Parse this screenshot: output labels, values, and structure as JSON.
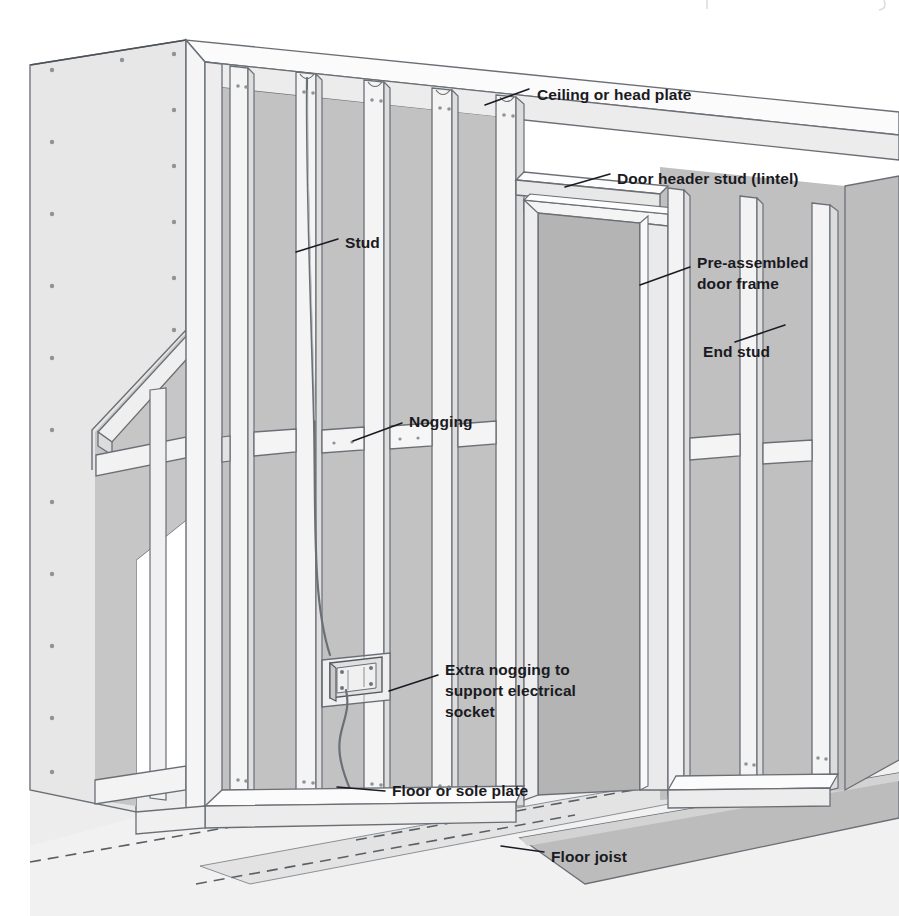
{
  "figure": {
    "type": "isometric-cutaway-diagram",
    "background_color": "#ffffff"
  },
  "palette": {
    "line": "#5a5f66",
    "line_dark": "#3d4248",
    "text": "#1a1a22",
    "board_face": "#e9e9e9",
    "board_face_light": "#efefef",
    "cavity": "#c3c3c3",
    "cavity_dark": "#b2b2b2",
    "door_opening": "#b4b4b4",
    "timber_face": "#f3f3f3",
    "timber_side": "#dcdcdc",
    "timber_top": "#fbfbfb",
    "floor": "#e4e4e4",
    "floor_dark": "#cfcfcf",
    "joist": "#bdbdbd"
  },
  "labels": [
    {
      "id": "ceiling-head-plate",
      "text": "Ceiling or head plate",
      "text_x": 537,
      "text_y": 94,
      "anchor": "start",
      "leader": "M 528 88 L 487 104"
    },
    {
      "id": "door-header-stud",
      "text": "Door header stud (lintel)",
      "text_x": 617,
      "text_y": 178,
      "anchor": "start",
      "leader": "M 609 173 L 566 186"
    },
    {
      "id": "stud",
      "text": "Stud",
      "text_x": 345,
      "text_y": 243,
      "anchor": "start",
      "leader": "M 337 238 L 295 251"
    },
    {
      "id": "pre-assembled-door-frame",
      "text": "Pre-assembled",
      "text_x": 697,
      "text_y": 262,
      "anchor": "start",
      "leader": "M 689 268 L 639 284"
    },
    {
      "id": "pre-assembled-door-frame-line2",
      "text": "door frame",
      "text_x": 697,
      "text_y": 282,
      "anchor": "start",
      "leader": ""
    },
    {
      "id": "end-stud",
      "text": "End stud",
      "text_x": 703,
      "text_y": 351,
      "anchor": "start",
      "leader": "M 775 327 L 776 327 L 780 326"
    },
    {
      "id": "nogging",
      "text": "Nogging",
      "text_x": 409,
      "text_y": 421,
      "anchor": "start",
      "leader": "M 401 424 L 352 440"
    },
    {
      "id": "extra-nogging",
      "text": "Extra nogging to",
      "text_x": 445,
      "text_y": 669,
      "anchor": "start",
      "leader": "M 437 676 L 388 690"
    },
    {
      "id": "extra-nogging-line2",
      "text": "support electrical",
      "text_x": 445,
      "text_y": 690,
      "anchor": "start",
      "leader": ""
    },
    {
      "id": "extra-nogging-line3",
      "text": "socket",
      "text_x": 445,
      "text_y": 711,
      "anchor": "start",
      "leader": ""
    },
    {
      "id": "floor-sole-plate",
      "text": "Floor or sole plate",
      "text_x": 392,
      "text_y": 790,
      "anchor": "start",
      "leader": "M 384 792 L 336 788"
    },
    {
      "id": "floor-joist",
      "text": "Floor joist",
      "text_x": 551,
      "text_y": 856,
      "anchor": "start",
      "leader": "M 543 851 L 500 845"
    }
  ],
  "leader_lines": [
    {
      "id": "leader-ceiling-head-plate",
      "d": "M 529 89 L 485 105"
    },
    {
      "id": "leader-door-header",
      "d": "M 610 174 L 565 187"
    },
    {
      "id": "leader-stud",
      "d": "M 338 239 L 296 252"
    },
    {
      "id": "leader-door-frame",
      "d": "M 690 267 L 640 285"
    },
    {
      "id": "leader-end-stud",
      "d": "M 785 325 L 735 342"
    },
    {
      "id": "leader-nogging",
      "d": "M 402 423 L 353 441"
    },
    {
      "id": "leader-extra-nogging",
      "d": "M 438 675 L 389 691"
    },
    {
      "id": "leader-floor-plate",
      "d": "M 385 791 L 337 787"
    },
    {
      "id": "leader-floor-joist",
      "d": "M 544 852 L 501 846"
    }
  ]
}
